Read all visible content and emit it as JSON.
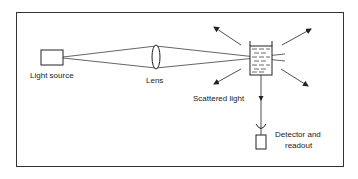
{
  "diagram": {
    "type": "light-scattering-apparatus",
    "labels": {
      "light_source": "Light source",
      "lens": "Lens",
      "scattered_light": "Scattered light",
      "detector_line1": "Detector and",
      "detector_line2": "readout"
    },
    "colors": {
      "stroke": "#222222",
      "background": "#ffffff",
      "border": "#333333"
    }
  }
}
